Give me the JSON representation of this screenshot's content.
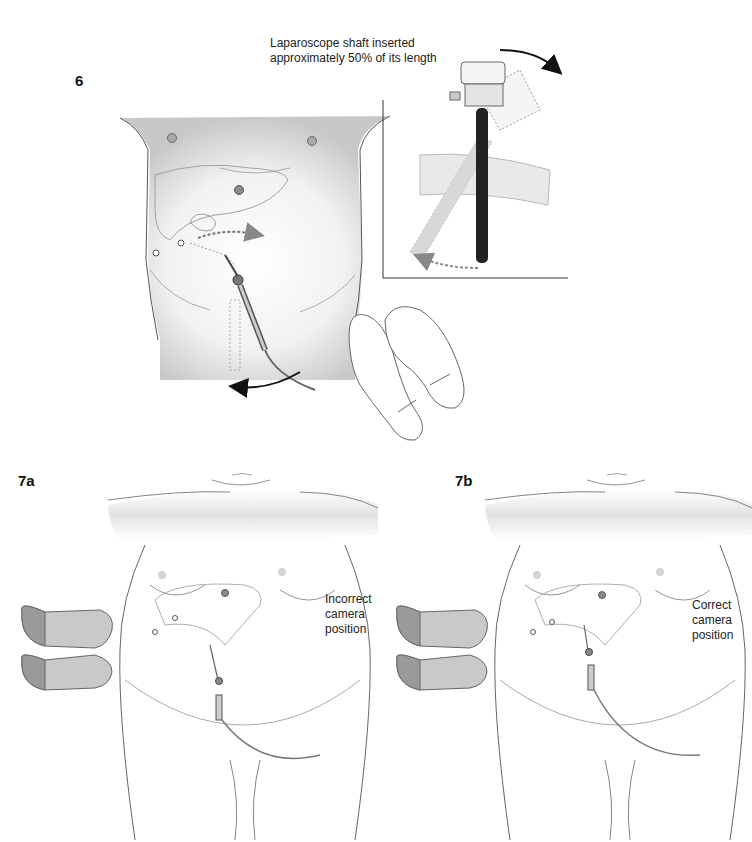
{
  "figures": {
    "fig6": {
      "label": "6",
      "inset_caption_line1": "Laparoscope shaft inserted",
      "inset_caption_line2": "approximately 50% of its length"
    },
    "fig7a": {
      "label": "7a",
      "caption_line1": "Incorrect",
      "caption_line2": "camera",
      "caption_line3": "position"
    },
    "fig7b": {
      "label": "7b",
      "caption_line1": "Correct",
      "caption_line2": "camera",
      "caption_line3": "position"
    }
  },
  "colors": {
    "line": "#555555",
    "shade": "#cfcfcf",
    "port": "#8a8a8a",
    "foot_fill": "#c9c9c9",
    "foot_toe": "#9a9a9a",
    "scope_shaft": "#222222",
    "arrow_dark": "#111111",
    "arrow_grey": "#888888"
  }
}
